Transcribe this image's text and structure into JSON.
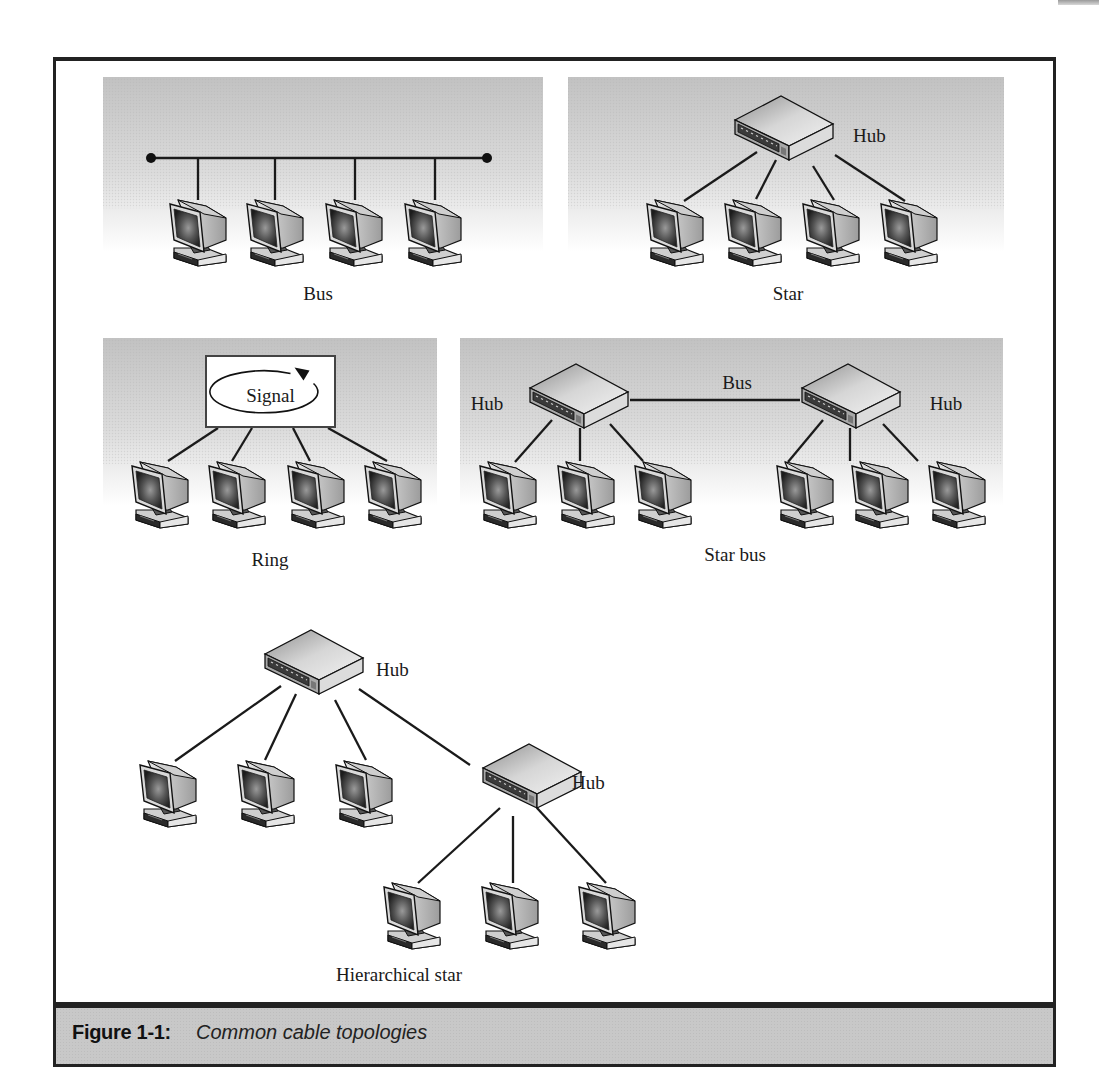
{
  "figure": {
    "label": "Figure 1-1:",
    "title": "Common cable topologies"
  },
  "colors": {
    "frame": "#222222",
    "caption_bg": "#c8c8c8",
    "backdrop_top": "#c4c4c4",
    "backdrop_bottom": "#ffffff",
    "wire": "#1a1a1a"
  },
  "panels": [
    {
      "id": "bus",
      "x": 103,
      "y": 77,
      "w": 440,
      "h": 175
    },
    {
      "id": "star",
      "x": 568,
      "y": 77,
      "w": 436,
      "h": 175
    },
    {
      "id": "ring",
      "x": 103,
      "y": 338,
      "w": 334,
      "h": 168
    },
    {
      "id": "star-bus",
      "x": 460,
      "y": 338,
      "w": 543,
      "h": 168
    }
  ],
  "topologies": {
    "bus": {
      "label": "Bus",
      "label_pos": [
        318,
        300
      ],
      "backbone": {
        "x1": 151,
        "y1": 158,
        "x2": 487,
        "y2": 158
      },
      "terminators": [
        [
          151,
          158
        ],
        [
          487,
          158
        ]
      ],
      "drops": [
        [
          198,
          158,
          198,
          200
        ],
        [
          275,
          158,
          275,
          200
        ],
        [
          355,
          158,
          355,
          200
        ],
        [
          435,
          158,
          435,
          200
        ]
      ],
      "computers": [
        [
          168,
          196
        ],
        [
          245,
          196
        ],
        [
          324,
          196
        ],
        [
          403,
          196
        ]
      ]
    },
    "star": {
      "label": "Star",
      "label_pos": [
        788,
        300
      ],
      "hub": {
        "x": 733,
        "y": 94,
        "label": "Hub",
        "label_pos": [
          853,
          142
        ]
      },
      "links": [
        [
          757,
          152,
          684,
          201
        ],
        [
          776,
          160,
          756,
          199
        ],
        [
          813,
          166,
          834,
          200
        ],
        [
          835,
          155,
          905,
          201
        ]
      ],
      "computers": [
        [
          645,
          196
        ],
        [
          723,
          196
        ],
        [
          801,
          196
        ],
        [
          879,
          196
        ]
      ]
    },
    "ring": {
      "label": "Ring",
      "label_pos": [
        270,
        566
      ],
      "signal_box": {
        "x": 206,
        "y": 356,
        "w": 129,
        "h": 71,
        "text": "Signal"
      },
      "links": [
        [
          218,
          428,
          168,
          461
        ],
        [
          252,
          428,
          232,
          461
        ],
        [
          293,
          428,
          310,
          461
        ],
        [
          328,
          428,
          387,
          461
        ]
      ],
      "computers": [
        [
          130,
          458
        ],
        [
          207,
          458
        ],
        [
          286,
          458
        ],
        [
          363,
          458
        ]
      ]
    },
    "star_bus": {
      "label": "Star bus",
      "label_pos": [
        735,
        561
      ],
      "bus_label": "Bus",
      "bus_label_pos": [
        737,
        389
      ],
      "bus_line": {
        "x1": 630,
        "y1": 400,
        "x2": 800,
        "y2": 400
      },
      "hubs": [
        {
          "x": 528,
          "y": 362,
          "label": "Hub",
          "label_pos": [
            487,
            410
          ]
        },
        {
          "x": 800,
          "y": 362,
          "label": "Hub",
          "label_pos": [
            946,
            410
          ]
        }
      ],
      "links": [
        [
          552,
          420,
          515,
          462
        ],
        [
          580,
          428,
          580,
          461
        ],
        [
          610,
          424,
          643,
          461
        ],
        [
          823,
          420,
          788,
          462
        ],
        [
          850,
          428,
          850,
          461
        ],
        [
          883,
          424,
          918,
          461
        ]
      ],
      "computers": [
        [
          478,
          458
        ],
        [
          556,
          458
        ],
        [
          633,
          458
        ],
        [
          775,
          458
        ],
        [
          850,
          458
        ],
        [
          927,
          458
        ]
      ]
    },
    "hierarchical_star": {
      "label": "Hierarchical star",
      "label_pos": [
        399,
        981
      ],
      "hubs": [
        {
          "x": 263,
          "y": 628,
          "label": "Hub",
          "label_pos": [
            376,
            676
          ]
        },
        {
          "x": 481,
          "y": 742,
          "label": "Hub",
          "label_pos": [
            572,
            789
          ]
        }
      ],
      "links": [
        [
          281,
          686,
          175,
          761
        ],
        [
          296,
          694,
          265,
          760
        ],
        [
          335,
          700,
          366,
          760
        ],
        [
          359,
          689,
          470,
          765
        ],
        [
          500,
          808,
          418,
          883
        ],
        [
          513,
          816,
          513,
          883
        ],
        [
          537,
          808,
          606,
          883
        ]
      ],
      "computers": [
        [
          138,
          757
        ],
        [
          236,
          757
        ],
        [
          334,
          757
        ],
        [
          382,
          879
        ],
        [
          480,
          879
        ],
        [
          577,
          879
        ]
      ]
    }
  }
}
